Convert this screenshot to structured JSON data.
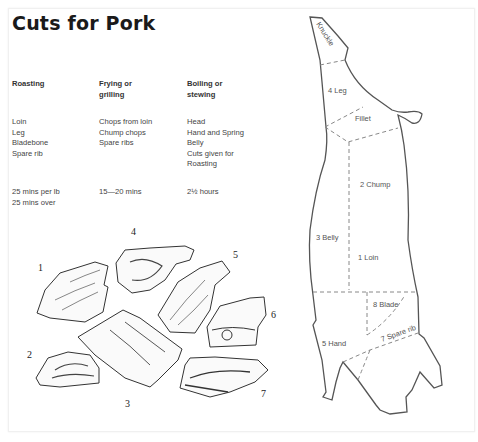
{
  "page": {
    "title": "Cuts for Pork"
  },
  "columns": [
    {
      "header": [
        "Roasting"
      ],
      "cuts": [
        "Loin",
        "Leg",
        "Bladebone",
        "Spare rib"
      ],
      "time": [
        "25 mins per lb",
        "25 mins over"
      ]
    },
    {
      "header": [
        "Frying or",
        "grilling"
      ],
      "cuts": [
        "Chops from loin",
        "Chump chops",
        "Spare ribs"
      ],
      "time": [
        "15—20 mins"
      ]
    },
    {
      "header": [
        "Boiling or",
        "stewing"
      ],
      "cuts": [
        "Head",
        "Hand and Spring",
        "Belly",
        "Cuts given for",
        "Roasting"
      ],
      "time": [
        "2½ hours"
      ]
    }
  ],
  "illustration_numbers": [
    "1",
    "2",
    "3",
    "4",
    "5",
    "6",
    "7"
  ],
  "diagram": {
    "labels": {
      "knuckle": "Knuckle",
      "leg": "4 Leg",
      "fillet": "Fillet",
      "chump": "2 Chump",
      "belly": "3 Belly",
      "loin": "1 Loin",
      "blade": "8 Blade",
      "spare_rib": "7 Spare rib",
      "hand": "5 Hand"
    }
  },
  "colors": {
    "text": "#333333",
    "title": "#1a1a1a",
    "outline": "#555555"
  }
}
